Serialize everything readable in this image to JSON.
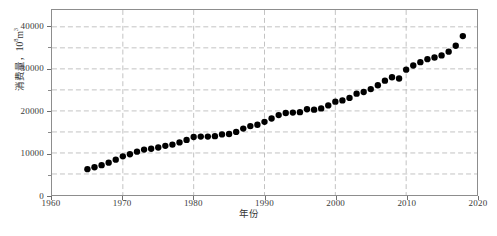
{
  "chart_data": {
    "type": "scatter",
    "title": "",
    "xlabel": "年份",
    "ylabel": "消费量，10⁸m³",
    "ylabel_main": "消费量，10",
    "ylabel_exp": "8",
    "ylabel_unit": "m",
    "ylabel_unit_exp": "3",
    "xlim": [
      1960,
      2020
    ],
    "ylim": [
      0,
      44000
    ],
    "xticks": [
      1960,
      1970,
      1980,
      1990,
      2000,
      2010,
      2020
    ],
    "xtick_labels": [
      "1960",
      "1970",
      "1980",
      "1990",
      "2000",
      "2010",
      "2020"
    ],
    "yticks": [
      0,
      10000,
      20000,
      30000,
      40000
    ],
    "ytick_labels": [
      "0",
      "10000",
      "20000",
      "30000",
      "40000"
    ],
    "y_minor_gridlines": [
      5000,
      10000,
      15000,
      20000,
      25000,
      30000,
      35000,
      40000
    ],
    "grid": true,
    "grid_style": "dashed",
    "grid_color": "#b3b3b3",
    "marker": "filled-circle",
    "marker_color": "#000000",
    "marker_size": 4.6,
    "axis_color": "#8d8d8d",
    "background": "#ffffff",
    "x": [
      1965,
      1966,
      1967,
      1968,
      1969,
      1970,
      1971,
      1972,
      1973,
      1974,
      1975,
      1976,
      1977,
      1978,
      1979,
      1980,
      1981,
      1982,
      1983,
      1984,
      1985,
      1986,
      1987,
      1988,
      1989,
      1990,
      1991,
      1992,
      1993,
      1994,
      1995,
      1996,
      1997,
      1998,
      1999,
      2000,
      2001,
      2002,
      2003,
      2004,
      2005,
      2006,
      2007,
      2008,
      2009,
      2010,
      2011,
      2012,
      2013,
      2014,
      2015,
      2016,
      2017,
      2018
    ],
    "values": [
      6150,
      6600,
      7100,
      7700,
      8400,
      9200,
      9700,
      10300,
      10800,
      11000,
      11300,
      11700,
      12000,
      12500,
      13100,
      13800,
      13900,
      13900,
      14000,
      14400,
      14500,
      15000,
      15800,
      16400,
      16700,
      17400,
      18200,
      19000,
      19500,
      19600,
      19700,
      20400,
      20300,
      20600,
      21300,
      22200,
      22500,
      23100,
      24100,
      24500,
      25200,
      26100,
      27200,
      28000,
      27700,
      29800,
      30800,
      31600,
      32300,
      32700,
      33200,
      34100,
      35500,
      37800
    ],
    "series_name": "消费量",
    "annotations": []
  },
  "figure": {
    "caption": ""
  }
}
